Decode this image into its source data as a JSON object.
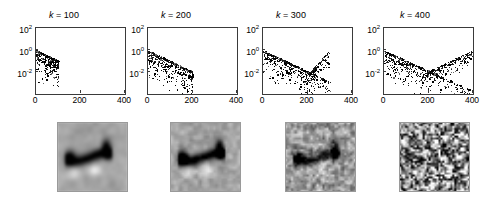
{
  "figure": {
    "background": "#ffffff",
    "point_color": "#1a1a1a",
    "axis_color": "#3a3a3a"
  },
  "chart_data": {
    "type": "scatter",
    "title": "",
    "panel_count": 4,
    "shared_axes": {
      "xlabel": "",
      "ylabel": "",
      "xlim": [
        0,
        400
      ],
      "ylim": [
        0.0001,
        100
      ],
      "yscale": "log",
      "xscale": "linear",
      "xticks": [
        0,
        200,
        400
      ],
      "xticklabels": [
        "0",
        "200",
        "400"
      ],
      "yticks": [
        100,
        1,
        0.01
      ],
      "yticklabels": [
        "10^2",
        "10^0",
        "10^-2"
      ],
      "grid": false,
      "legend": false
    },
    "panels": [
      {
        "title": "k = 100",
        "k": 100,
        "xmax_data": 100,
        "trend": "monotonic decay",
        "description": "dense cloud of points confined to x in 0-110, upper envelope decaying from about 10^0 at x=0 to 10^-1 at x=100, scatter spreading down to 10^-3",
        "envelope_start": 1.0,
        "envelope_end": 0.12,
        "has_upturn": false
      },
      {
        "title": "k = 200",
        "k": 200,
        "xmax_data": 200,
        "trend": "monotonic decay",
        "description": "points span x in 0-200, upper envelope decays from about 10^0 to 10^-2, broad scatter beneath reaching 10^-4",
        "envelope_start": 1.0,
        "envelope_end": 0.012,
        "has_upturn": false
      },
      {
        "title": "k = 300",
        "k": 300,
        "xmax_data": 300,
        "trend": "decay with upturn",
        "description": "points span x in 0-300, main envelope decays from 10^0 to 10^-3, with a rising branch of points after x about 200 climbing back toward 10^-1",
        "envelope_start": 1.0,
        "envelope_end": 0.0015,
        "has_upturn": true,
        "upturn_x": 200
      },
      {
        "title": "k = 400",
        "k": 400,
        "xmax_data": 400,
        "trend": "V shape",
        "description": "points span full range x in 0-400, descending envelope from 10^0 down to 10^-4 crossing a rising branch that climbs from 10^-2 near x=180 up to 10^0 at x=400",
        "envelope_start": 1.0,
        "envelope_end": 0.0002,
        "has_upturn": true,
        "upturn_x": 170
      }
    ]
  },
  "images": {
    "row_label": "",
    "items": [
      {
        "name": "reconstruction-k100",
        "caption": "",
        "quality": "smooth blurred reconstruction, low noise, object clearly visible"
      },
      {
        "name": "reconstruction-k200",
        "caption": "",
        "quality": "sharper reconstruction, slight texture, object clearly visible"
      },
      {
        "name": "reconstruction-k300",
        "caption": "",
        "quality": "visible high frequency noise over the object, contrast reduced"
      },
      {
        "name": "reconstruction-k400",
        "caption": "",
        "quality": "dominated by high frequency noise, object no longer discernible"
      }
    ]
  }
}
